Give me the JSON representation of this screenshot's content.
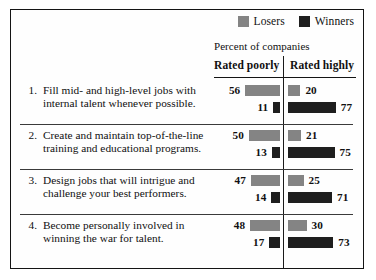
{
  "legend": {
    "entries": [
      {
        "label": "Losers",
        "color": "#848484"
      },
      {
        "label": "Winners",
        "color": "#1e1e1e"
      }
    ]
  },
  "subtitle": "Percent of companies",
  "columns": [
    {
      "header": "Rated poorly"
    },
    {
      "header": "Rated highly"
    }
  ],
  "rows": [
    {
      "number": "1.",
      "text": "Fill mid- and high-level jobs with internal talent whenever possible.",
      "poorly": {
        "losers": "56",
        "winners": "11"
      },
      "highly": {
        "losers": "20",
        "winners": "77"
      }
    },
    {
      "number": "2.",
      "text": "Create and maintain top-of-the-line training and educational programs.",
      "poorly": {
        "losers": "50",
        "winners": "13"
      },
      "highly": {
        "losers": "21",
        "winners": "75"
      }
    },
    {
      "number": "3.",
      "text": "Design jobs that will intrigue and challenge your best performers.",
      "poorly": {
        "losers": "47",
        "winners": "14"
      },
      "highly": {
        "losers": "25",
        "winners": "71"
      }
    },
    {
      "number": "4.",
      "text": "Become personally involved in winning the war for talent.",
      "poorly": {
        "losers": "48",
        "winners": "17"
      },
      "highly": {
        "losers": "30",
        "winners": "73"
      }
    }
  ],
  "chart_data": {
    "type": "bar",
    "title": "",
    "subtitle": "Percent of companies",
    "xlabel": "",
    "ylabel": "",
    "xlim": [
      0,
      100
    ],
    "grid": false,
    "legend_position": "top-right",
    "orientation": "horizontal",
    "categories": [
      "1. Fill mid- and high-level jobs with internal talent whenever possible.",
      "2. Create and maintain top-of-the-line training and educational programs.",
      "3. Design jobs that will intrigue and challenge your best performers.",
      "4. Become personally involved in winning the war for talent."
    ],
    "panels": [
      {
        "name": "Rated poorly",
        "series": [
          {
            "name": "Losers",
            "values": [
              56,
              50,
              47,
              48
            ]
          },
          {
            "name": "Winners",
            "values": [
              11,
              13,
              14,
              17
            ]
          }
        ]
      },
      {
        "name": "Rated highly",
        "series": [
          {
            "name": "Losers",
            "values": [
              20,
              21,
              25,
              30
            ]
          },
          {
            "name": "Winners",
            "values": [
              77,
              75,
              71,
              73
            ]
          }
        ]
      }
    ]
  }
}
